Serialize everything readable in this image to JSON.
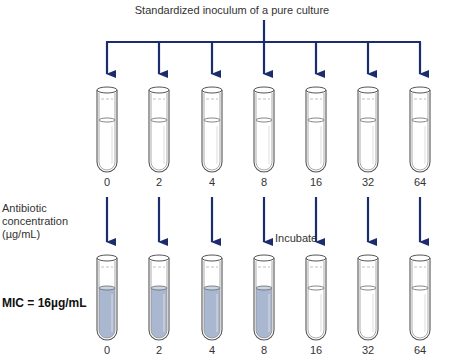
{
  "title": "Standardized inoculum of a pure culture",
  "side_label": {
    "line1": "Antibiotic",
    "line2": "concentration",
    "line3": "(µg/mL)"
  },
  "incubate_label": "Incubate",
  "mic_label": "MIC = 16µg/mL",
  "colors": {
    "arrow": "#1c2d6e",
    "growth_fill": "#a9b8d0",
    "clear_fill": "#ffffff",
    "tube_outline": "#555555"
  },
  "tubes_top": [
    {
      "concentration": "0",
      "state": "clear"
    },
    {
      "concentration": "2",
      "state": "clear"
    },
    {
      "concentration": "4",
      "state": "clear"
    },
    {
      "concentration": "8",
      "state": "clear"
    },
    {
      "concentration": "16",
      "state": "clear"
    },
    {
      "concentration": "32",
      "state": "clear"
    },
    {
      "concentration": "64",
      "state": "clear"
    }
  ],
  "tubes_bottom": [
    {
      "concentration": "0",
      "state": "turbid"
    },
    {
      "concentration": "2",
      "state": "turbid"
    },
    {
      "concentration": "4",
      "state": "turbid"
    },
    {
      "concentration": "8",
      "state": "turbid"
    },
    {
      "concentration": "16",
      "state": "clear"
    },
    {
      "concentration": "32",
      "state": "clear"
    },
    {
      "concentration": "64",
      "state": "clear"
    }
  ]
}
